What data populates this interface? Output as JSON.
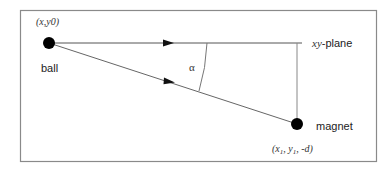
{
  "diagram": {
    "type": "physics-geometry",
    "labels": {
      "ball_coords": "(x,y0)",
      "ball": "ball",
      "plane": "xy-plane",
      "plane_italic": "xy",
      "plane_suffix": "-plane",
      "angle": "α",
      "magnet": "magnet",
      "magnet_coords_prefix": "(x",
      "magnet_sub1": "1",
      "magnet_coords_mid": ", y",
      "magnet_sub2": "1",
      "magnet_coords_suffix": ", -d)"
    },
    "colors": {
      "border": "#888888",
      "line": "#666666",
      "point": "#000000",
      "text": "#222222"
    },
    "elements": [
      {
        "id": "ball",
        "kind": "point",
        "x": 49,
        "y": 43
      },
      {
        "id": "magnet",
        "kind": "point",
        "x": 297,
        "y": 124
      },
      {
        "id": "horizontal-line",
        "kind": "line",
        "from": [
          49,
          43
        ],
        "to": [
          300,
          43
        ]
      },
      {
        "id": "slant-line",
        "kind": "line",
        "from": [
          49,
          43
        ],
        "to": [
          297,
          124
        ]
      },
      {
        "id": "projection-line",
        "kind": "line",
        "from": [
          297,
          43
        ],
        "to": [
          297,
          124
        ]
      },
      {
        "id": "angle-arc",
        "kind": "arc",
        "label": "α"
      }
    ]
  }
}
